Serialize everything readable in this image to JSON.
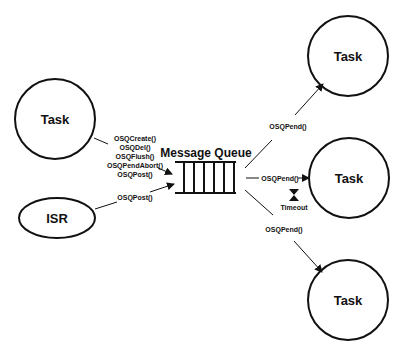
{
  "diagram": {
    "title": "Message Queue",
    "nodes": {
      "task_left": "Task",
      "isr": "ISR",
      "task_top_right": "Task",
      "task_mid_right": "Task",
      "task_bottom_right": "Task"
    },
    "task_calls": [
      "OSQCreate()",
      "OSQDel()",
      "OSQFlush()",
      "OSQPendAbort()",
      "OSQPost()"
    ],
    "isr_call": "OSQPost()",
    "pend_top": "OSQPend()",
    "pend_mid": "OSQPend()",
    "pend_bottom": "OSQPend()",
    "timeout": "Timeout",
    "queue_slots": 6,
    "colors": {
      "stroke": "#111111",
      "background": "#ffffff"
    }
  }
}
